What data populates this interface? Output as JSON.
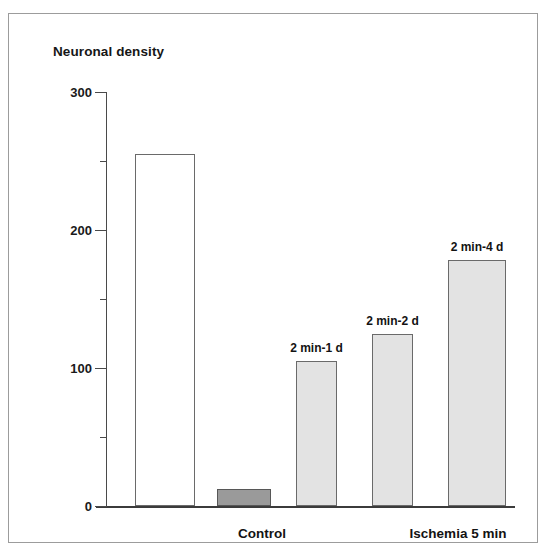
{
  "chart_data": {
    "type": "bar",
    "title": "Neuronal density",
    "xlabel": "",
    "ylabel": "Neuronal density",
    "ylim": [
      0,
      300
    ],
    "y_ticks_major": [
      0,
      100,
      200,
      300
    ],
    "y_ticks_major_labels": [
      "0",
      "100",
      "200",
      "300"
    ],
    "y_ticks_minor": [
      50,
      150,
      250
    ],
    "grid": false,
    "legend": null,
    "categories": [
      "Control",
      "",
      "2 min-1 d",
      "2 min-2 d",
      "2 min-4 d"
    ],
    "values": [
      255,
      12,
      105,
      125,
      178
    ],
    "bars": [
      {
        "label": "",
        "value": 255,
        "fill": "#ffffff",
        "stroke": "#6a6a6a",
        "group": "Control"
      },
      {
        "label": "",
        "value": 12,
        "fill": "#9a9a9a",
        "stroke": "#575757",
        "group": "Ischemia 5 min"
      },
      {
        "label": "2 min-1 d",
        "value": 105,
        "fill": "#e3e3e3",
        "stroke": "#6a6a6a",
        "group": "Ischemia 5 min"
      },
      {
        "label": "2 min-2 d",
        "value": 125,
        "fill": "#e3e3e3",
        "stroke": "#6a6a6a",
        "group": "Ischemia 5 min"
      },
      {
        "label": "2 min-4 d",
        "value": 178,
        "fill": "#e3e3e3",
        "stroke": "#6a6a6a",
        "group": "Ischemia 5 min"
      }
    ],
    "group_captions": [
      {
        "text": "Control",
        "center_px": 156
      },
      {
        "text": "Ischemia 5 min",
        "center_px": 352
      }
    ],
    "axis_color": "#4a4a4a",
    "frame_color": "#9c9c9c",
    "text_color": "#161616"
  },
  "geometry": {
    "plot_left": 97,
    "plot_top": 78,
    "plot_width": 409,
    "plot_height": 414,
    "bars_px": [
      {
        "x": 29,
        "w": 60
      },
      {
        "x": 111,
        "w": 54
      },
      {
        "x": 190,
        "w": 41
      },
      {
        "x": 266,
        "w": 41
      },
      {
        "x": 342,
        "w": 58
      }
    ]
  }
}
